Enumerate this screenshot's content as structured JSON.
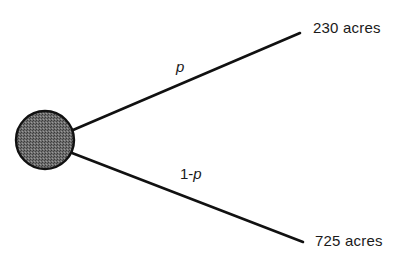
{
  "diagram": {
    "type": "decision-tree-chance-node",
    "chance_node": {
      "cx": 45,
      "cy": 140,
      "r": 29,
      "fill": "#5a5a5a",
      "stroke": "#111111"
    },
    "branches": [
      {
        "probability_label": "p",
        "outcome_label": "230 acres",
        "line": {
          "x1": 73,
          "y1": 130,
          "x2": 300,
          "y2": 33
        }
      },
      {
        "probability_label_prefix": "1-",
        "probability_label_var": "p",
        "outcome_label": "725 acres",
        "line": {
          "x1": 72,
          "y1": 153,
          "x2": 303,
          "y2": 242
        }
      }
    ]
  }
}
